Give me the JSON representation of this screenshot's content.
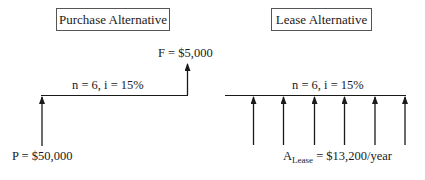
{
  "purchase": {
    "title": "Purchase Alternative",
    "period_label": "n = 6, i = 15%",
    "present_value_label": "P = $50,000",
    "future_value_label": "F = $5,000"
  },
  "lease": {
    "title": "Lease Alternative",
    "period_label": "n = 6, i = 15%",
    "annuity_symbol": "A",
    "annuity_subscript": "Lease",
    "annuity_value": " = $13,200/year",
    "arrow_count": 6
  },
  "colors": {
    "line": "#1a1a1a",
    "box_border": "#555555"
  }
}
